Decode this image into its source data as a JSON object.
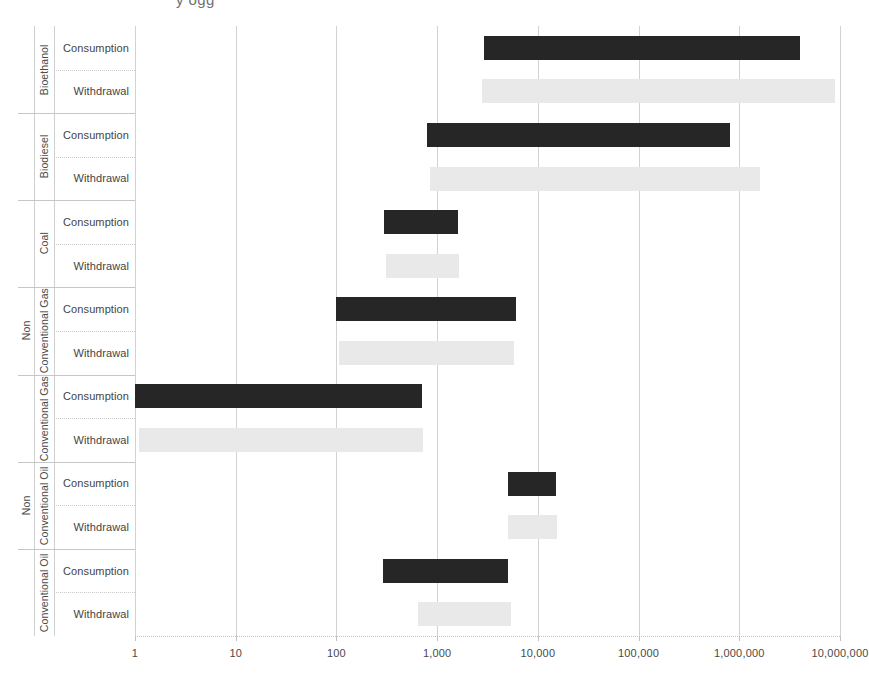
{
  "title_artifact": "y ogg",
  "chart_data": {
    "type": "bar",
    "subtype": "floating-range-bar",
    "title": "",
    "xlabel": "",
    "ylabel": "",
    "xscale": "log",
    "xlim": [
      1,
      10000000
    ],
    "grid": true,
    "legend_position": "none",
    "xticks": [
      1,
      10,
      100,
      1000,
      10000,
      100000,
      1000000,
      10000000
    ],
    "xticklabels": [
      "1",
      "10",
      "100",
      "1,000",
      "10,000",
      "100,000",
      "1,000,000",
      "10,000,000"
    ],
    "row_measures": [
      "Consumption",
      "Withdrawal"
    ],
    "groups": [
      {
        "name": "Bioethanol",
        "outer": "",
        "rows": [
          {
            "measure": "Consumption",
            "low": 2900,
            "high": 4000000,
            "color": "#262626"
          },
          {
            "measure": "Withdrawal",
            "low": 2800,
            "high": 9000000,
            "color": "#e9e9e9"
          }
        ]
      },
      {
        "name": "Biodiesel",
        "outer": "",
        "rows": [
          {
            "measure": "Consumption",
            "low": 800,
            "high": 800000,
            "color": "#262626"
          },
          {
            "measure": "Withdrawal",
            "low": 850,
            "high": 1600000,
            "color": "#e9e9e9"
          }
        ]
      },
      {
        "name": "Coal",
        "outer": "",
        "rows": [
          {
            "measure": "Consumption",
            "low": 300,
            "high": 1600,
            "color": "#262626"
          },
          {
            "measure": "Withdrawal",
            "low": 310,
            "high": 1650,
            "color": "#e9e9e9"
          }
        ]
      },
      {
        "name": "Conventional Gas",
        "outer": "Non",
        "rows": [
          {
            "measure": "Consumption",
            "low": 100,
            "high": 6000,
            "color": "#262626"
          },
          {
            "measure": "Withdrawal",
            "low": 105,
            "high": 5800,
            "color": "#e9e9e9"
          }
        ]
      },
      {
        "name": "Conventional Gas",
        "outer": "",
        "rows": [
          {
            "measure": "Consumption",
            "low": 1,
            "high": 700,
            "color": "#262626"
          },
          {
            "measure": "Withdrawal",
            "low": 1.1,
            "high": 730,
            "color": "#e9e9e9"
          }
        ]
      },
      {
        "name": "Conventional Oil",
        "outer": "Non",
        "rows": [
          {
            "measure": "Consumption",
            "low": 5000,
            "high": 15000,
            "color": "#262626"
          },
          {
            "measure": "Withdrawal",
            "low": 5100,
            "high": 15500,
            "color": "#e9e9e9"
          }
        ]
      },
      {
        "name": "Conventional Oil",
        "outer": "",
        "rows": [
          {
            "measure": "Consumption",
            "low": 290,
            "high": 5000,
            "color": "#262626"
          },
          {
            "measure": "Withdrawal",
            "low": 650,
            "high": 5400,
            "color": "#e9e9e9"
          }
        ]
      }
    ]
  }
}
